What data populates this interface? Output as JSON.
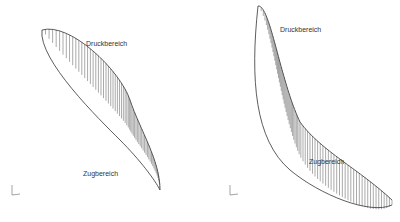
{
  "figures": [
    {
      "id": "left",
      "labels": {
        "top": "Druckbereich",
        "bottom": "Zugbereich"
      }
    },
    {
      "id": "right",
      "labels": {
        "top": "Druckbereich",
        "bottom": "Zugbereich"
      }
    }
  ]
}
